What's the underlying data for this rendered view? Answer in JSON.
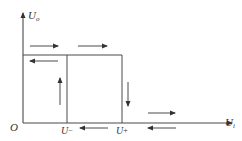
{
  "diagram": {
    "y_axis": {
      "label": "U",
      "subscript": "o"
    },
    "x_axis": {
      "label": "U",
      "subscript": "i"
    },
    "origin_label": "O",
    "thresholds": [
      {
        "label": "U−",
        "base": "U",
        "sup": "−"
      },
      {
        "label": "U+",
        "base": "U",
        "sup": "+"
      }
    ],
    "colors": {
      "line": "#4a4a4a",
      "text": "#333333",
      "background": "#ffffff"
    },
    "arrows": [
      {
        "id": "top-left-right",
        "direction": "right"
      },
      {
        "id": "top-right-right",
        "direction": "right"
      },
      {
        "id": "upper-left",
        "direction": "left"
      },
      {
        "id": "u-minus-up",
        "direction": "up"
      },
      {
        "id": "u-plus-down",
        "direction": "down"
      },
      {
        "id": "bottom-right",
        "direction": "right"
      },
      {
        "id": "bottom-left-1",
        "direction": "left"
      },
      {
        "id": "bottom-left-2",
        "direction": "left"
      }
    ]
  }
}
